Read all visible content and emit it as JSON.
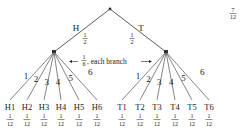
{
  "diagram": {
    "type": "probability-tree",
    "root": {
      "x": 110,
      "y": 9
    },
    "corner_fraction": {
      "num": "7",
      "den": "12"
    },
    "level1": [
      {
        "id": "H",
        "label": "H",
        "prob_num": "1",
        "prob_den": "2",
        "x": 54,
        "y": 52
      },
      {
        "id": "T",
        "label": "T",
        "prob_num": "1",
        "prob_den": "2",
        "x": 166,
        "y": 52
      }
    ],
    "annotation": {
      "prefix_num": "1",
      "prefix_den": "6",
      "text": ", each branch"
    },
    "branch_labels": [
      "1",
      "2",
      "3",
      "4",
      "5",
      "6"
    ],
    "leaves": {
      "H": [
        {
          "label": "H1",
          "x": 10,
          "num": "1",
          "den": "12"
        },
        {
          "label": "H2",
          "x": 27,
          "num": "1",
          "den": "12"
        },
        {
          "label": "H3",
          "x": 44,
          "num": "1",
          "den": "12"
        },
        {
          "label": "H4",
          "x": 61,
          "num": "1",
          "den": "12"
        },
        {
          "label": "H5",
          "x": 79,
          "num": "1",
          "den": "12"
        },
        {
          "label": "H6",
          "x": 97,
          "num": "1",
          "den": "12"
        }
      ],
      "T": [
        {
          "label": "T1",
          "x": 122,
          "num": "1",
          "den": "12"
        },
        {
          "label": "T2",
          "x": 140,
          "num": "1",
          "den": "12"
        },
        {
          "label": "T3",
          "x": 157,
          "num": "1",
          "den": "12"
        },
        {
          "label": "T4",
          "x": 175,
          "num": "1",
          "den": "12"
        },
        {
          "label": "T5",
          "x": 192,
          "num": "1",
          "den": "12"
        },
        {
          "label": "T6",
          "x": 209,
          "num": "1",
          "den": "12"
        }
      ]
    },
    "leaf_line_end_y": 100,
    "colors": {
      "line": "#333333",
      "text": "#222222",
      "background": "#ffffff"
    }
  }
}
